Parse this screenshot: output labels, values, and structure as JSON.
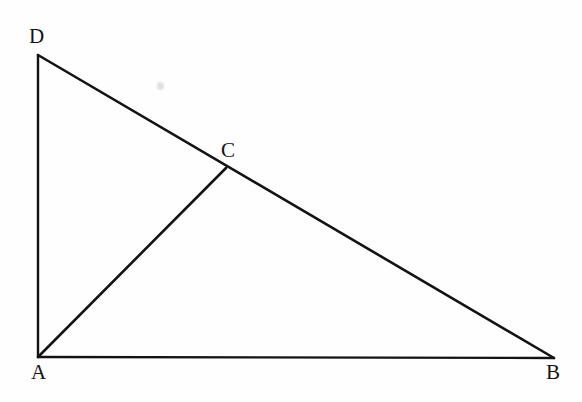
{
  "figure": {
    "background_color": "#fefefe",
    "stroke_color": "#131313",
    "label_color": "#131313",
    "width": 582,
    "height": 402
  },
  "points": {
    "A": {
      "label": "A",
      "x": 38,
      "y": 357,
      "label_x": 31,
      "label_y": 362
    },
    "B": {
      "label": "B",
      "x": 554,
      "y": 358,
      "label_x": 546,
      "label_y": 362
    },
    "C": {
      "label": "C",
      "x": 226,
      "y": 168,
      "label_x": 221,
      "label_y": 140
    },
    "D": {
      "label": "D",
      "x": 38,
      "y": 55,
      "label_x": 29,
      "label_y": 26
    }
  },
  "segments": [
    {
      "name": "AD",
      "from": "A",
      "to": "D",
      "stroke_width": 2.4
    },
    {
      "name": "AB",
      "from": "A",
      "to": "B",
      "stroke_width": 2.4
    },
    {
      "name": "DB",
      "from": "D",
      "to": "B",
      "stroke_width": 2.6
    },
    {
      "name": "AC",
      "from": "A",
      "to": "C",
      "stroke_width": 2.6
    }
  ],
  "artifacts": [
    {
      "name": "scan-smudge",
      "x": 157,
      "y": 82
    }
  ],
  "chart_data": {
    "type": "diagram",
    "vertices": [
      {
        "name": "A",
        "x": 38,
        "y": 357
      },
      {
        "name": "B",
        "x": 554,
        "y": 358
      },
      {
        "name": "C",
        "x": 226,
        "y": 168
      },
      {
        "name": "D",
        "x": 38,
        "y": 55
      }
    ],
    "edges": [
      "A-D",
      "A-B",
      "D-B",
      "A-C"
    ]
  }
}
